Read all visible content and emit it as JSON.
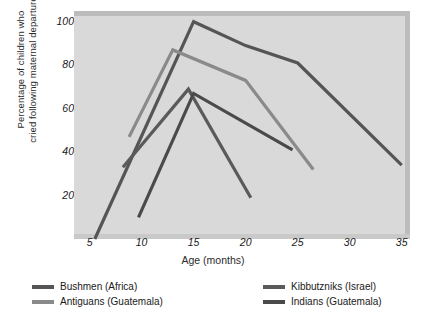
{
  "chart_data": {
    "type": "line",
    "title": "",
    "xlabel": "Age (months)",
    "ylabel": "Percentage of children who cried following maternal departure",
    "xlim": [
      3.5,
      35.8
    ],
    "ylim": [
      0,
      104
    ],
    "xticks": [
      5,
      10,
      15,
      20,
      25,
      30,
      35
    ],
    "xtick_labels": [
      "5",
      "10",
      "15",
      "20",
      "25",
      "30",
      "35"
    ],
    "yticks": [
      20,
      40,
      60,
      80,
      100
    ],
    "ytick_labels": [
      "20",
      "40",
      "60",
      "80",
      "100"
    ],
    "grid": false,
    "legend_position": "below",
    "plot_background": "#d9d9d9",
    "series": [
      {
        "name": "Bushmen (Africa)",
        "color": "#555555",
        "points": [
          [
            5.5,
            0
          ],
          [
            15,
            100
          ],
          [
            20,
            89
          ],
          [
            25,
            81
          ],
          [
            35,
            34
          ]
        ]
      },
      {
        "name": "Antiguans (Guatemala)",
        "color": "#8a8a8a",
        "points": [
          [
            8.8,
            47
          ],
          [
            13,
            87
          ],
          [
            20,
            73
          ],
          [
            26.5,
            32
          ]
        ]
      },
      {
        "name": "Kibbutzniks (Israel)",
        "color": "#5a5a5a",
        "points": [
          [
            8.2,
            33
          ],
          [
            14.5,
            69
          ],
          [
            20.5,
            19
          ]
        ]
      },
      {
        "name": "Indians (Guatemala)",
        "color": "#4a4a4a",
        "points": [
          [
            9.7,
            10
          ],
          [
            15,
            67
          ],
          [
            24.5,
            41
          ]
        ]
      }
    ]
  },
  "legend": {
    "items": [
      {
        "label": "Bushmen (Africa)",
        "color": "#555555"
      },
      {
        "label": "Antiguans (Guatemala)",
        "color": "#8a8a8a"
      },
      {
        "label": "Kibbutzniks (Israel)",
        "color": "#5a5a5a"
      },
      {
        "label": "Indians (Guatemala)",
        "color": "#4a4a4a"
      }
    ]
  },
  "axis": {
    "ylabel_line1": "Percentage of children who",
    "ylabel_line2": "cried following maternal departure"
  }
}
